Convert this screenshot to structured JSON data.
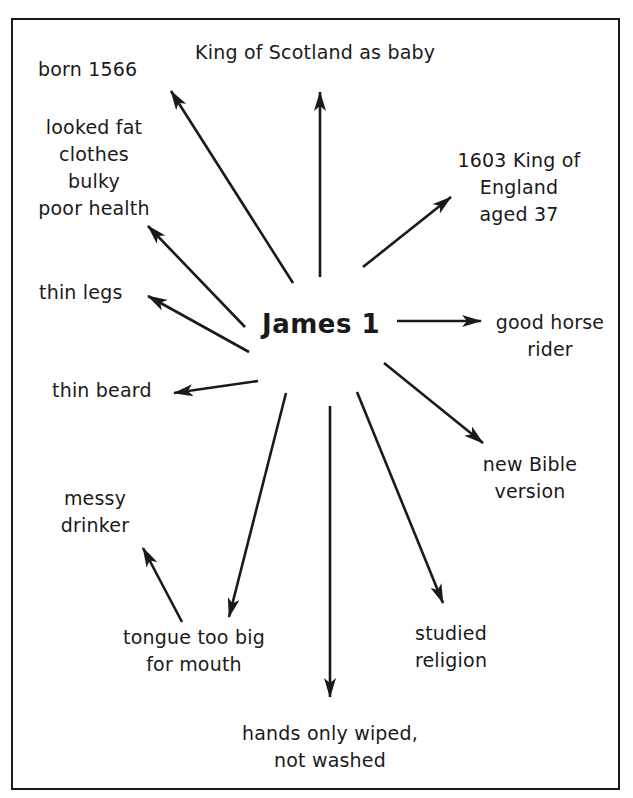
{
  "diagram": {
    "type": "spider-diagram",
    "center": {
      "label": "James 1"
    },
    "nodes": [
      {
        "id": "born",
        "lines": [
          "born 1566"
        ]
      },
      {
        "id": "king-scotland",
        "lines": [
          "King of Scotland as baby"
        ]
      },
      {
        "id": "king-england",
        "lines": [
          "1603 King of",
          "England",
          "aged 37"
        ]
      },
      {
        "id": "looked-fat",
        "lines": [
          "looked fat",
          "clothes",
          "bulky",
          "poor health"
        ]
      },
      {
        "id": "thin-legs",
        "lines": [
          "thin legs"
        ]
      },
      {
        "id": "horse-rider",
        "lines": [
          "good horse",
          "rider"
        ]
      },
      {
        "id": "thin-beard",
        "lines": [
          "thin beard"
        ]
      },
      {
        "id": "bible",
        "lines": [
          "new Bible",
          "version"
        ]
      },
      {
        "id": "messy-drinker",
        "lines": [
          "messy",
          "drinker"
        ]
      },
      {
        "id": "tongue",
        "lines": [
          "tongue too big",
          "for mouth"
        ]
      },
      {
        "id": "religion",
        "lines": [
          "studied",
          "religion"
        ]
      },
      {
        "id": "hands",
        "lines": [
          "hands only wiped,",
          "not washed"
        ]
      }
    ],
    "edges": [
      {
        "from": "James 1",
        "to": "born 1566"
      },
      {
        "from": "James 1",
        "to": "King of Scotland as baby"
      },
      {
        "from": "James 1",
        "to": "1603 King of England aged 37"
      },
      {
        "from": "James 1",
        "to": "looked fat clothes bulky poor health"
      },
      {
        "from": "James 1",
        "to": "thin legs"
      },
      {
        "from": "James 1",
        "to": "good horse rider"
      },
      {
        "from": "James 1",
        "to": "thin beard"
      },
      {
        "from": "James 1",
        "to": "new Bible version"
      },
      {
        "from": "James 1",
        "to": "tongue too big for mouth"
      },
      {
        "from": "James 1",
        "to": "studied religion"
      },
      {
        "from": "James 1",
        "to": "hands only wiped, not washed"
      },
      {
        "from": "tongue too big for mouth",
        "to": "messy drinker"
      }
    ],
    "colors": {
      "ink": "#1a1a1a",
      "background": "#ffffff"
    }
  }
}
